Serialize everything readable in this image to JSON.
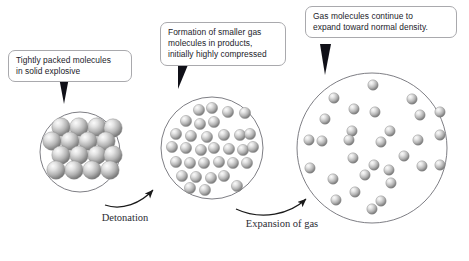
{
  "diagram": {
    "background_color": "#ffffff",
    "callout_border_color": "#a9a9ad",
    "callout_text_color": "#1b1b2a",
    "circle_stroke_color": "#6f6f76",
    "sphere_color_light": "#f2f2f2",
    "sphere_color_mid": "#b6b6b6",
    "sphere_color_dark": "#6b6b6b",
    "arrow_color": "#1a1a1a"
  },
  "callouts": [
    {
      "id": "callout-1",
      "text": "Tightly packed molecules\nin solid explosive",
      "points_to": "stage-1-circle"
    },
    {
      "id": "callout-2",
      "text": "Formation of smaller gas\nmolecules in products,\ninitially highly compressed",
      "points_to": "stage-2-circle"
    },
    {
      "id": "callout-3",
      "text": "Gas molecules continue to\nexpand toward normal density.",
      "points_to": "stage-3-circle"
    }
  ],
  "arc_labels": [
    {
      "id": "label-detonation",
      "text": "Detonation"
    },
    {
      "id": "label-expansion",
      "text": "Expansion\nof gas"
    }
  ],
  "stages": [
    {
      "id": "stage-1",
      "name": "solid-explosive",
      "circle": {
        "cx": 80,
        "cy": 152,
        "r": 40
      },
      "sphere_radius": 9.2,
      "molecule_count": 15,
      "packing": "close-packed-lattice",
      "molecules": [
        [
          61,
          127
        ],
        [
          79,
          127
        ],
        [
          97,
          127
        ],
        [
          113,
          128
        ],
        [
          52,
          141
        ],
        [
          70,
          141
        ],
        [
          88,
          141
        ],
        [
          106,
          141
        ],
        [
          61,
          155
        ],
        [
          79,
          155
        ],
        [
          97,
          155
        ],
        [
          113,
          155
        ],
        [
          56,
          170
        ],
        [
          74,
          170
        ],
        [
          92,
          170
        ],
        [
          110,
          170
        ]
      ]
    },
    {
      "id": "stage-2",
      "name": "compressed-gas-products",
      "circle": {
        "cx": 212,
        "cy": 148,
        "r": 51
      },
      "sphere_radius": 5.6,
      "molecule_count": 31,
      "packing": "scattered-dense",
      "molecules": [
        [
          199,
          110
        ],
        [
          212,
          108
        ],
        [
          228,
          112
        ],
        [
          245,
          113
        ],
        [
          186,
          121
        ],
        [
          200,
          124
        ],
        [
          214,
          122
        ],
        [
          176,
          134
        ],
        [
          191,
          136
        ],
        [
          207,
          137
        ],
        [
          224,
          135
        ],
        [
          240,
          135
        ],
        [
          250,
          134
        ],
        [
          172,
          147
        ],
        [
          186,
          148
        ],
        [
          201,
          150
        ],
        [
          214,
          148
        ],
        [
          229,
          149
        ],
        [
          243,
          150
        ],
        [
          253,
          147
        ],
        [
          176,
          162
        ],
        [
          190,
          163
        ],
        [
          204,
          163
        ],
        [
          219,
          162
        ],
        [
          233,
          163
        ],
        [
          247,
          163
        ],
        [
          182,
          176
        ],
        [
          196,
          177
        ],
        [
          211,
          178
        ],
        [
          224,
          176
        ],
        [
          190,
          188
        ],
        [
          205,
          190
        ],
        [
          237,
          186
        ]
      ]
    },
    {
      "id": "stage-3",
      "name": "expanded-gas",
      "circle": {
        "cx": 372,
        "cy": 148,
        "r": 75
      },
      "sphere_radius": 5.2,
      "molecule_count": 30,
      "packing": "scattered-sparse",
      "molecules": [
        [
          373,
          85
        ],
        [
          334,
          98
        ],
        [
          412,
          99
        ],
        [
          325,
          119
        ],
        [
          354,
          109
        ],
        [
          375,
          112
        ],
        [
          420,
          115
        ],
        [
          440,
          112
        ],
        [
          352,
          131
        ],
        [
          390,
          131
        ],
        [
          309,
          140
        ],
        [
          322,
          141
        ],
        [
          349,
          140
        ],
        [
          381,
          142
        ],
        [
          418,
          140
        ],
        [
          440,
          135
        ],
        [
          353,
          158
        ],
        [
          310,
          168
        ],
        [
          374,
          165
        ],
        [
          389,
          170
        ],
        [
          422,
          166
        ],
        [
          440,
          165
        ],
        [
          365,
          175
        ],
        [
          333,
          179
        ],
        [
          391,
          183
        ],
        [
          355,
          192
        ],
        [
          336,
          200
        ],
        [
          381,
          201
        ],
        [
          372,
          209
        ],
        [
          404,
          156
        ]
      ]
    }
  ],
  "arrows": [
    {
      "id": "arrow-detonation",
      "from": "stage-1",
      "to": "stage-2"
    },
    {
      "id": "arrow-expansion",
      "from": "stage-2",
      "to": "stage-3"
    }
  ]
}
